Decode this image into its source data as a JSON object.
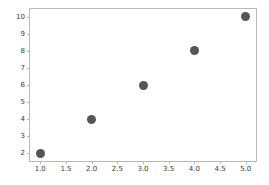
{
  "chart_data": {
    "type": "scatter",
    "title": "",
    "xlabel": "",
    "ylabel": "",
    "x": [
      1,
      2,
      3,
      4,
      5
    ],
    "values": [
      2,
      4,
      6,
      8,
      10
    ],
    "series": [
      {
        "name": "",
        "x": [
          1,
          2,
          3,
          4,
          5
        ],
        "values": [
          2,
          4,
          6,
          8,
          10
        ]
      }
    ],
    "points": [
      {
        "x": 1,
        "y": 2
      },
      {
        "x": 2,
        "y": 4
      },
      {
        "x": 3,
        "y": 6
      },
      {
        "x": 4,
        "y": 8
      },
      {
        "x": 5,
        "y": 10
      }
    ],
    "xlim": [
      0.8,
      5.2
    ],
    "ylim": [
      1.55,
      10.45
    ],
    "xticks": [
      1.0,
      1.5,
      2.0,
      2.5,
      3.0,
      3.5,
      4.0,
      4.5,
      5.0
    ],
    "xtick_labels": [
      "1.0",
      "1.5",
      "2.0",
      "2.5",
      "3.0",
      "3.5",
      "4.0",
      "4.5",
      "5.0"
    ],
    "yticks": [
      2,
      3,
      4,
      5,
      6,
      7,
      8,
      9,
      10
    ],
    "ytick_labels": [
      "2",
      "3",
      "4",
      "5",
      "6",
      "7",
      "8",
      "9",
      "10"
    ],
    "grid": false,
    "legend": false,
    "legend_position": "none",
    "marker_color": "#555555",
    "marker_shape": "circle",
    "axis_color": "#b8b8b8",
    "background_color": "#ffffff"
  }
}
